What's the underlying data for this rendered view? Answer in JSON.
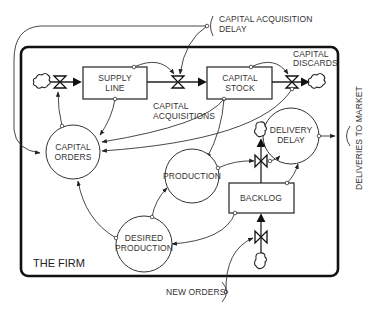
{
  "diagram": {
    "boundary_label": "THE FIRM",
    "stocks": {
      "supply_line": [
        "SUPPLY",
        "LINE"
      ],
      "capital_stock": [
        "CAPITAL",
        "STOCK"
      ],
      "backlog": "BACKLOG"
    },
    "auxiliaries": {
      "capital_orders": [
        "CAPITAL",
        "ORDERS"
      ],
      "production": "PRODUCTION",
      "delivery_delay": [
        "DELIVERY",
        "DELAY"
      ],
      "desired_production": [
        "DESIRED",
        "PRODUCTION"
      ]
    },
    "flows": {
      "capital_acquisitions": [
        "CAPITAL",
        "ACQUISITIONS"
      ],
      "capital_discards": [
        "CAPITAL",
        "DISCARDS"
      ]
    },
    "external_inputs": {
      "capital_acquisition_delay": [
        "CAPITAL ACQUISITION",
        "DELAY"
      ],
      "new_orders": "NEW ORDERS",
      "deliveries_to_market": "DELIVERIES TO MARKET"
    }
  }
}
